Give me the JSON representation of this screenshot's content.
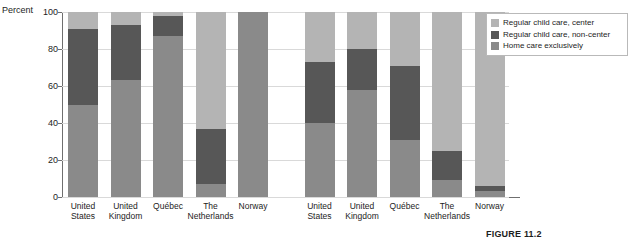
{
  "axis": {
    "y_title": "Percent",
    "y_ticks": [
      0,
      20,
      40,
      60,
      80,
      100
    ]
  },
  "legend": {
    "items": [
      {
        "label": "Regular child care, center",
        "color": "#b4b4b4",
        "key": "center"
      },
      {
        "label": "Regular child care, non-center",
        "color": "#575757",
        "key": "noncenter"
      },
      {
        "label": "Home care exclusively",
        "color": "#8a8a8a",
        "key": "home"
      }
    ]
  },
  "caption": {
    "text": "FIGURE 11.2"
  },
  "chart_data": {
    "type": "bar",
    "subtype": "stacked",
    "title": "",
    "xlabel": "",
    "ylabel": "Percent",
    "ylim": [
      0,
      100
    ],
    "grid": true,
    "legend_position": "top-right",
    "groups": [
      {
        "name": "group-1",
        "categories": [
          "United States",
          "United Kingdom",
          "Québec",
          "The Netherlands",
          "Norway"
        ]
      },
      {
        "name": "group-2",
        "categories": [
          "United States",
          "United Kingdom",
          "Québec",
          "The Netherlands",
          "Norway"
        ]
      }
    ],
    "categories": [
      "United States",
      "United Kingdom",
      "Québec",
      "The Netherlands",
      "Norway",
      "United States",
      "United Kingdom",
      "Québec",
      "The Netherlands",
      "Norway"
    ],
    "series": [
      {
        "name": "Home care exclusively",
        "color": "#8a8a8a",
        "values": [
          50,
          63,
          87,
          7,
          100,
          40,
          58,
          31,
          9,
          3
        ]
      },
      {
        "name": "Regular child care, non-center",
        "color": "#575757",
        "values": [
          41,
          30,
          11,
          30,
          0,
          33,
          22,
          40,
          16,
          3
        ]
      },
      {
        "name": "Regular child care, center",
        "color": "#b4b4b4",
        "values": [
          9,
          7,
          2,
          63,
          0,
          27,
          20,
          29,
          75,
          94
        ]
      }
    ]
  }
}
